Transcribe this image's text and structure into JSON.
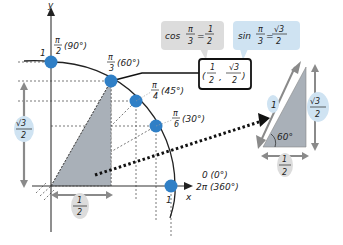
{
  "axes": {
    "x_label": "x",
    "y_label": "y"
  },
  "unit_circle": {
    "radius_label": "1",
    "points": [
      {
        "id": "p90",
        "angle_rad": "π/2",
        "num": "π",
        "den": "2",
        "deg": "(90°)"
      },
      {
        "id": "p60",
        "angle_rad": "π/3",
        "num": "π",
        "den": "3",
        "deg": "(60°)"
      },
      {
        "id": "p45",
        "angle_rad": "π/4",
        "num": "π",
        "den": "4",
        "deg": "(45°)"
      },
      {
        "id": "p30",
        "angle_rad": "π/6",
        "num": "π",
        "den": "6",
        "deg": "(30°)"
      },
      {
        "id": "p0",
        "line1": "0  (0°)",
        "line2": "2π  (360°)"
      }
    ],
    "y_axis_one": "1",
    "x_axis_one": "1"
  },
  "callouts": {
    "cos": {
      "prefix": "cos",
      "num": "π",
      "den": "3",
      "eq": "=",
      "rnum": "1",
      "rden": "2"
    },
    "sin": {
      "prefix": "sin",
      "num": "π",
      "den": "3",
      "eq": "=",
      "rnum": "√3",
      "rden": "2"
    },
    "coord": {
      "xnum": "1",
      "xden": "2",
      "sep": ",",
      "ynum": "√3",
      "yden": "2"
    }
  },
  "measures": {
    "height": {
      "num": "√3",
      "den": "2"
    },
    "base": {
      "num": "1",
      "den": "2"
    }
  },
  "side_triangle": {
    "hyp": "1",
    "angle": "60°",
    "height": {
      "num": "√3",
      "den": "2"
    },
    "base": {
      "num": "1",
      "den": "2"
    }
  },
  "colors": {
    "point": "#2f7fc6",
    "triangle_fill": "#a9b0b8",
    "cos_box": "#dcdcdc",
    "sin_box": "#cfe3f2",
    "arrow_gray": "#8a8a8a"
  }
}
